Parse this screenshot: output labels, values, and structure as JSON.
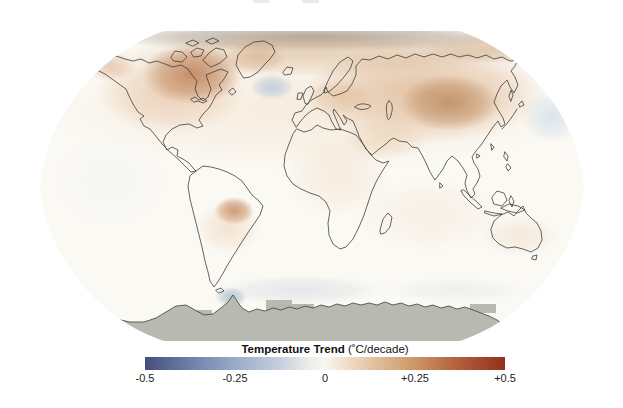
{
  "legend": {
    "title": "Temperature Trend",
    "units": " (˚C/decade)",
    "ticks": [
      "-0.5",
      "-0.25",
      "0",
      "+0.25",
      "+0.5"
    ],
    "gradient_stops": [
      {
        "pos": 0,
        "color": "#474e7c"
      },
      {
        "pos": 12,
        "color": "#6b7ea8"
      },
      {
        "pos": 25,
        "color": "#98abc9"
      },
      {
        "pos": 37,
        "color": "#c4cedd"
      },
      {
        "pos": 46,
        "color": "#edeee9"
      },
      {
        "pos": 50,
        "color": "#f8f6f0"
      },
      {
        "pos": 54,
        "color": "#f3e7d6"
      },
      {
        "pos": 63,
        "color": "#e3c3a0"
      },
      {
        "pos": 75,
        "color": "#cd9666"
      },
      {
        "pos": 87,
        "color": "#b35f3a"
      },
      {
        "pos": 100,
        "color": "#92301f"
      }
    ]
  },
  "map": {
    "ocean_base": "#fbf9f4",
    "no_data_color": "#b8bab2",
    "patches": [
      {
        "name": "north-polar-band",
        "cx": 312,
        "cy": 37,
        "rx": 215,
        "ry": 15,
        "color": "#a99a8b",
        "opacity": 0.85
      },
      {
        "name": "north-polar-warm",
        "cx": 312,
        "cy": 55,
        "rx": 195,
        "ry": 22,
        "color": "#d0a87e",
        "opacity": 0.5
      },
      {
        "name": "nh-midlat-warm-wash",
        "cx": 310,
        "cy": 110,
        "rx": 260,
        "ry": 60,
        "color": "#f3e2cd",
        "opacity": 0.55
      },
      {
        "name": "canada-broad-warm",
        "cx": 170,
        "cy": 92,
        "rx": 75,
        "ry": 42,
        "color": "#ddb08a",
        "opacity": 0.5
      },
      {
        "name": "arctic-canada-strong",
        "cx": 192,
        "cy": 74,
        "rx": 50,
        "ry": 30,
        "color": "#ba7a4e",
        "opacity": 0.8
      },
      {
        "name": "alaska-warm",
        "cx": 110,
        "cy": 66,
        "rx": 26,
        "ry": 15,
        "color": "#d5a075",
        "opacity": 0.5
      },
      {
        "name": "greenland-warm",
        "cx": 257,
        "cy": 57,
        "rx": 30,
        "ry": 17,
        "color": "#d0a278",
        "opacity": 0.5
      },
      {
        "name": "north-atlantic-cool",
        "cx": 272,
        "cy": 87,
        "rx": 22,
        "ry": 13,
        "color": "#b5c8da",
        "opacity": 0.8
      },
      {
        "name": "eurasia-broad-warm",
        "cx": 425,
        "cy": 92,
        "rx": 120,
        "ry": 52,
        "color": "#d5a377",
        "opacity": 0.6
      },
      {
        "name": "siberia-strong",
        "cx": 450,
        "cy": 103,
        "rx": 50,
        "ry": 28,
        "color": "#b57e4e",
        "opacity": 0.7
      },
      {
        "name": "east-arctic-warm",
        "cx": 500,
        "cy": 48,
        "rx": 80,
        "ry": 16,
        "color": "#c8a076",
        "opacity": 0.55
      },
      {
        "name": "europe-warm",
        "cx": 340,
        "cy": 97,
        "rx": 34,
        "ry": 18,
        "color": "#dbb28a",
        "opacity": 0.45
      },
      {
        "name": "mideast-warm",
        "cx": 384,
        "cy": 140,
        "rx": 42,
        "ry": 20,
        "color": "#e8c8a4",
        "opacity": 0.5
      },
      {
        "name": "north-pacific-cool",
        "cx": 552,
        "cy": 117,
        "rx": 30,
        "ry": 26,
        "color": "#cfdde8",
        "opacity": 0.7
      },
      {
        "name": "brazil-strong",
        "cx": 234,
        "cy": 211,
        "rx": 20,
        "ry": 14,
        "color": "#bd7848",
        "opacity": 0.8
      },
      {
        "name": "south-america-warm",
        "cx": 228,
        "cy": 228,
        "rx": 32,
        "ry": 26,
        "color": "#e8c5a2",
        "opacity": 0.4
      },
      {
        "name": "africa-warm",
        "cx": 338,
        "cy": 175,
        "rx": 52,
        "ry": 42,
        "color": "#f0dcc5",
        "opacity": 0.45
      },
      {
        "name": "indian-ocean-warm",
        "cx": 430,
        "cy": 215,
        "rx": 75,
        "ry": 35,
        "color": "#f3e5d4",
        "opacity": 0.45
      },
      {
        "name": "australia-warm",
        "cx": 520,
        "cy": 236,
        "rx": 40,
        "ry": 20,
        "color": "#ead3b8",
        "opacity": 0.4
      },
      {
        "name": "east-pacific-neutral",
        "cx": 110,
        "cy": 180,
        "rx": 55,
        "ry": 45,
        "color": "#f2f4f3",
        "opacity": 0.6
      },
      {
        "name": "southern-ocean-cool-w",
        "cx": 300,
        "cy": 290,
        "rx": 85,
        "ry": 15,
        "color": "#d5dde2",
        "opacity": 0.6
      },
      {
        "name": "southern-ocean-cool-e",
        "cx": 455,
        "cy": 290,
        "rx": 70,
        "ry": 12,
        "color": "#e0e6ea",
        "opacity": 0.5
      },
      {
        "name": "antarctic-peninsula-cool",
        "cx": 231,
        "cy": 297,
        "rx": 16,
        "ry": 10,
        "color": "#a7bac9",
        "opacity": 0.8
      }
    ],
    "no_data_blocks": [
      {
        "x": 266,
        "y": 300,
        "w": 26,
        "h": 14
      },
      {
        "x": 290,
        "y": 304,
        "w": 24,
        "h": 12
      },
      {
        "x": 196,
        "y": 310,
        "w": 16,
        "h": 9
      },
      {
        "x": 470,
        "y": 304,
        "w": 26,
        "h": 9
      }
    ]
  },
  "artifacts": [
    {
      "x": 253,
      "y": 0,
      "w": 16,
      "h": 3,
      "color": "#f0e8e4"
    },
    {
      "x": 302,
      "y": 0,
      "w": 17,
      "h": 3,
      "color": "#efe7e3"
    }
  ]
}
